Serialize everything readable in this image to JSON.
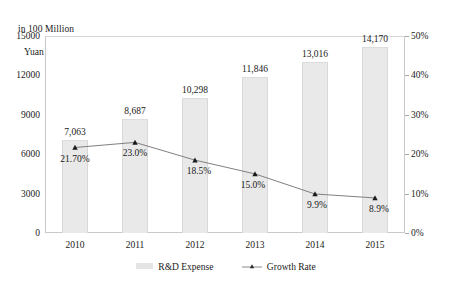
{
  "chart_data": {
    "type": "bar",
    "title": "",
    "subtitle": "",
    "ylabel": "in 100 Million\nYuan",
    "ylabel_line1": "in 100 Million",
    "ylabel_line2": "Yuan",
    "xlabel": "",
    "y2label": "",
    "categories": [
      "2010",
      "2011",
      "2012",
      "2013",
      "2014",
      "2015"
    ],
    "ylim": [
      0,
      15000
    ],
    "y2lim": [
      0,
      0.5
    ],
    "yticks": [
      "0",
      "3000",
      "6000",
      "9000",
      "12000",
      "15000"
    ],
    "ytick_values": [
      0,
      3000,
      6000,
      9000,
      12000,
      15000
    ],
    "y2ticks": [
      "0%",
      "10%",
      "20%",
      "30%",
      "40%",
      "50%"
    ],
    "y2tick_values": [
      0,
      10,
      20,
      30,
      40,
      50
    ],
    "grid": false,
    "legend_position": "bottom",
    "series": [
      {
        "name": "R&D Expense",
        "type": "bar",
        "axis": "left",
        "color": "#e9e9e9",
        "values": [
          7063,
          8687,
          10298,
          11846,
          13016,
          14170
        ],
        "labels": [
          "7,063",
          "8,687",
          "10,298",
          "11,846",
          "13,016",
          "14,170"
        ]
      },
      {
        "name": "Growth Rate",
        "type": "line",
        "axis": "right",
        "color": "#808080",
        "values": [
          21.7,
          23.0,
          18.5,
          15.0,
          9.9,
          8.9
        ],
        "labels": [
          "21.70%",
          "23.0%",
          "18.5%",
          "15.0%",
          "9.9%",
          "8.9%"
        ]
      }
    ]
  },
  "legend": {
    "items": [
      {
        "label": "R&D Expense",
        "marker": "bar-swatch-icon"
      },
      {
        "label": "Growth Rate",
        "marker": "line-marker-icon"
      }
    ]
  }
}
